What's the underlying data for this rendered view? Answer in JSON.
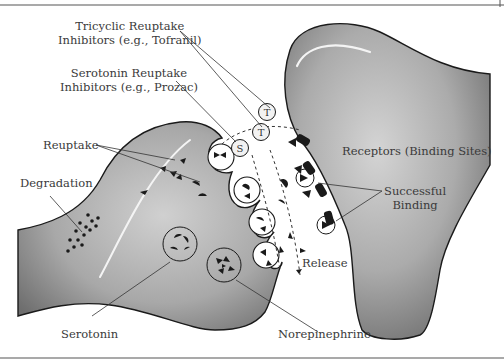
{
  "diagram": {
    "labels": {
      "tricyclic": {
        "line1": "Tricyclic Reuptake",
        "line2": "Inhibitors (e.g., Tofranil)"
      },
      "ssri": {
        "line1": "Serotonin Reuptake",
        "line2": "Inhibitors (e.g., Prozac)"
      },
      "reuptake": "Reuptake",
      "degradation": "Degradation",
      "receptors": "Receptors (Binding Sites)",
      "successful_binding": {
        "line1": "Successful",
        "line2": "Binding"
      },
      "release": "Release",
      "serotonin": "Serotonin",
      "norepinephrine": "Norepinephrine"
    },
    "markers": {
      "ssri_marker": "S",
      "tricyclic_marker_1": "T",
      "tricyclic_marker_2": "T"
    },
    "colors": {
      "neuron_fill_light": "#c8c8c8",
      "neuron_fill_dark": "#7a7a7a",
      "outline": "#1a1a1a",
      "molecule": "#1a1a1a",
      "text": "#3a3a3a",
      "border_rule": "#555555"
    }
  }
}
